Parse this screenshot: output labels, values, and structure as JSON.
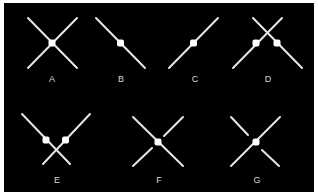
{
  "diagram": {
    "background": "#000000",
    "line_color": "#e6e6e6",
    "dot_color": "#ffffff",
    "figures": [
      {
        "id": "A",
        "label": "A",
        "description": "two full crossing lines with one dot at the intersection"
      },
      {
        "id": "B",
        "label": "B",
        "description": "single descending line with one dot at midpoint"
      },
      {
        "id": "C",
        "label": "C",
        "description": "single ascending line with one dot at midpoint"
      },
      {
        "id": "D",
        "label": "D",
        "description": "two lines crossing above, each with a dot below the crossing"
      },
      {
        "id": "E",
        "label": "E",
        "description": "two lines crossing below, each with a dot above the crossing"
      },
      {
        "id": "F",
        "label": "F",
        "description": "continuous descending line with dot at center; ascending line broken around the dot"
      },
      {
        "id": "G",
        "label": "G",
        "description": "continuous ascending line with dot at center; descending line broken around the dot"
      }
    ]
  }
}
